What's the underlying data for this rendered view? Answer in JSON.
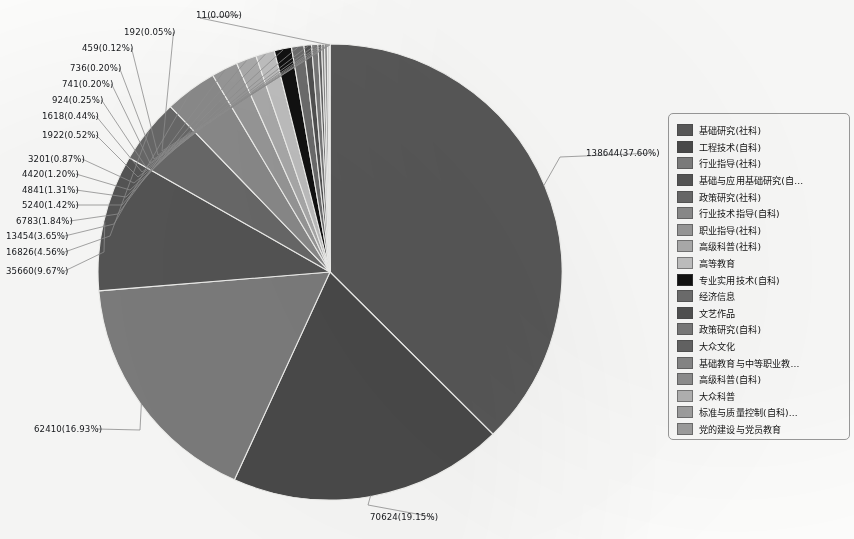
{
  "chart_data": {
    "type": "pie",
    "title": "",
    "subtitle": "",
    "xlabel": "",
    "ylabel": "",
    "legend_position": "right",
    "grid": false,
    "label_format": "value(percent)",
    "total": 368706,
    "start_angle_deg": 0,
    "direction": "clockwise",
    "categories": [
      "基础研究(社科)",
      "工程技术(自科)",
      "行业指导(社科)",
      "基础与应用基础研究(自...",
      "政策研究(社科)",
      "行业技术指导(自科)",
      "职业指导(社科)",
      "高级科普(社科)",
      "高等教育",
      "专业实用技术(自科)",
      "经济信息",
      "文艺作品",
      "政策研究(自科)",
      "大众文化",
      "基础教育与中等职业教...",
      "高级科普(自科)",
      "大众科普",
      "标准与质量控制(自科)...",
      "党的建设与党员教育"
    ],
    "values": [
      138644,
      70624,
      62410,
      35660,
      16826,
      13454,
      6783,
      5240,
      4841,
      4420,
      3201,
      1922,
      1618,
      924,
      741,
      736,
      459,
      192,
      11
    ],
    "percents": [
      "37.60%",
      "19.15%",
      "16.93%",
      "9.67%",
      "4.56%",
      "3.65%",
      "1.84%",
      "1.42%",
      "1.31%",
      "1.20%",
      "0.87%",
      "0.52%",
      "0.44%",
      "0.25%",
      "0.20%",
      "0.20%",
      "0.12%",
      "0.05%",
      "0.00%"
    ],
    "slice_labels": [
      "138644(37.60%)",
      "70624(19.15%)",
      "62410(16.93%)",
      "35660(9.67%)",
      "16826(4.56%)",
      "13454(3.65%)",
      "6783(1.84%)",
      "5240(1.42%)",
      "4841(1.31%)",
      "4420(1.20%)",
      "3201(0.87%)",
      "1922(0.52%)",
      "1618(0.44%)",
      "924(0.25%)",
      "741(0.20%)",
      "736(0.20%)",
      "459(0.12%)",
      "192(0.05%)",
      "11(0.00%)"
    ],
    "colors": [
      "#595959",
      "#4b4b4b",
      "#7e7e7e",
      "#565656",
      "#6a6a6a",
      "#8c8c8c",
      "#9a9a9a",
      "#adadad",
      "#c2c2c2",
      "#111111",
      "#6e6e6e",
      "#525252",
      "#7a7a7a",
      "#646464",
      "#888888",
      "#8f8f8f",
      "#b4b4b4",
      "#a0a0a0",
      "#9e9e9e"
    ]
  },
  "legend": {
    "items": [
      {
        "label": "基础研究(社科)",
        "color": "#595959"
      },
      {
        "label": "工程技术(自科)",
        "color": "#4b4b4b"
      },
      {
        "label": "行业指导(社科)",
        "color": "#7e7e7e"
      },
      {
        "label": "基础与应用基础研究(自...",
        "color": "#565656"
      },
      {
        "label": "政策研究(社科)",
        "color": "#6a6a6a"
      },
      {
        "label": "行业技术指导(自科)",
        "color": "#8c8c8c"
      },
      {
        "label": "职业指导(社科)",
        "color": "#9a9a9a"
      },
      {
        "label": "高级科普(社科)",
        "color": "#adadad"
      },
      {
        "label": "高等教育",
        "color": "#c2c2c2"
      },
      {
        "label": "专业实用技术(自科)",
        "color": "#111111"
      },
      {
        "label": "经济信息",
        "color": "#6e6e6e"
      },
      {
        "label": "文艺作品",
        "color": "#525252"
      },
      {
        "label": "政策研究(自科)",
        "color": "#7a7a7a"
      },
      {
        "label": "大众文化",
        "color": "#646464"
      },
      {
        "label": "基础教育与中等职业教...",
        "color": "#888888"
      },
      {
        "label": "高级科普(自科)",
        "color": "#8f8f8f"
      },
      {
        "label": "大众科普",
        "color": "#b4b4b4"
      },
      {
        "label": "标准与质量控制(自科)...",
        "color": "#a0a0a0"
      },
      {
        "label": "党的建设与党员教育",
        "color": "#9e9e9e"
      }
    ]
  }
}
